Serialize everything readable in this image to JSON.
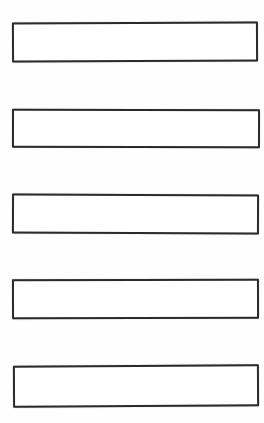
{
  "colors": {
    "background": "#fefefe",
    "box_stroke": "#2b2b2b",
    "box_fill": "#ffffff"
  },
  "boxes": [
    {
      "name": "box-1",
      "content": ""
    },
    {
      "name": "box-2",
      "content": ""
    },
    {
      "name": "box-3",
      "content": ""
    },
    {
      "name": "box-4",
      "content": ""
    },
    {
      "name": "box-5",
      "content": ""
    }
  ]
}
